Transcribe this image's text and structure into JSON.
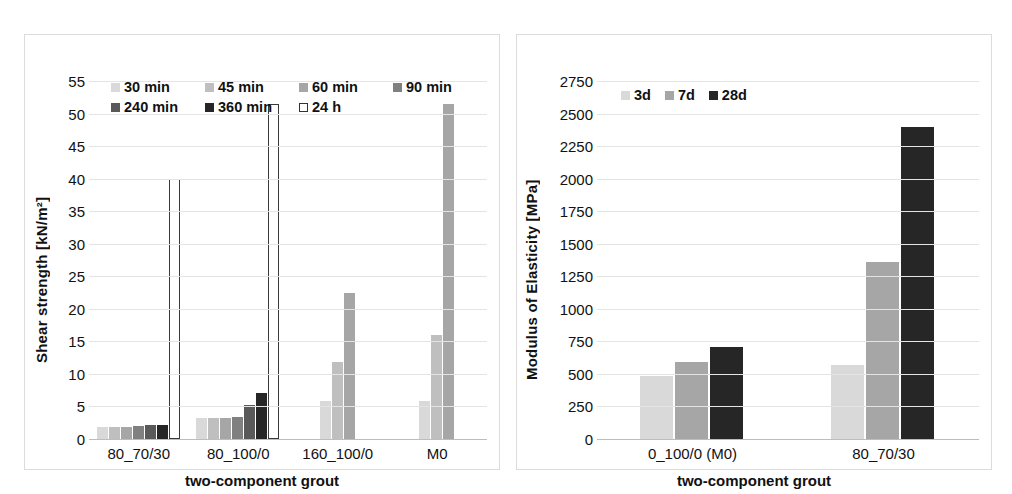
{
  "chart_data": [
    {
      "type": "bar",
      "panel": "left",
      "title": "",
      "xlabel": "two-component grout",
      "ylabel": "Shear strength [kN/m²]",
      "ylim": [
        0,
        55
      ],
      "ytick_step": 5,
      "yticks": [
        "55",
        "50",
        "45",
        "40",
        "35",
        "30",
        "25",
        "20",
        "15",
        "10",
        "5",
        "0"
      ],
      "grid": true,
      "legend_position": "top",
      "categories": [
        "80_70/30",
        "80_100/0",
        "160_100/0",
        "M0"
      ],
      "series": [
        {
          "name": "30 min",
          "color": "#d9d9d9",
          "values": [
            1.9,
            3.2,
            5.9,
            5.9
          ]
        },
        {
          "name": "45 min",
          "color": "#bfbfbf",
          "values": [
            1.9,
            3.2,
            11.9,
            16.0
          ]
        },
        {
          "name": "60 min",
          "color": "#a6a6a6",
          "values": [
            1.9,
            3.3,
            22.4,
            51.5
          ]
        },
        {
          "name": "90 min",
          "color": "#808080",
          "values": [
            2.0,
            3.4,
            null,
            null
          ]
        },
        {
          "name": "240 min",
          "color": "#595959",
          "values": [
            2.1,
            5.2,
            null,
            null
          ]
        },
        {
          "name": "360 min",
          "color": "#262626",
          "values": [
            2.1,
            7.0,
            null,
            null
          ]
        },
        {
          "name": "24 h",
          "color": "#ffffff",
          "values": [
            40.0,
            51.5,
            null,
            null
          ]
        }
      ]
    },
    {
      "type": "bar",
      "panel": "right",
      "title": "",
      "xlabel": "two-component grout",
      "ylabel": "Modulus of Elasticity [MPa]",
      "ylim": [
        0,
        2750
      ],
      "ytick_step": 250,
      "yticks": [
        "2750",
        "2500",
        "2250",
        "2000",
        "1750",
        "1500",
        "1250",
        "1000",
        "750",
        "500",
        "250",
        "0"
      ],
      "grid": true,
      "legend_position": "top",
      "categories": [
        "0_100/0 (M0)",
        "80_70/30"
      ],
      "series": [
        {
          "name": "3d",
          "color": "#d9d9d9",
          "values": [
            485,
            570
          ]
        },
        {
          "name": "7d",
          "color": "#a6a6a6",
          "values": [
            595,
            1360
          ]
        },
        {
          "name": "28d",
          "color": "#262626",
          "values": [
            705,
            2400
          ]
        }
      ]
    }
  ]
}
